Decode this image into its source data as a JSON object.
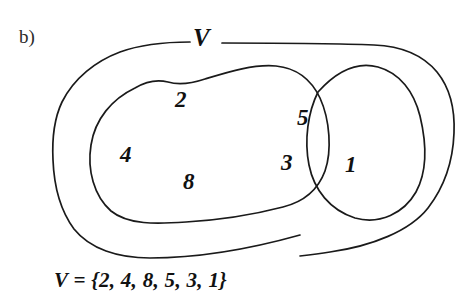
{
  "figure": {
    "part_label": "b)",
    "universe_label": "V",
    "caption": "V = {2, 4, 8, 5, 3, 1}",
    "ink_color": "#111111",
    "background_color": "#ffffff"
  },
  "regions": {
    "universal_set": {
      "name": "V",
      "icon": "rounded-outer-boundary-curve"
    },
    "left_set": {
      "icon": "left-blob-curve",
      "elements": [
        "2",
        "4",
        "8"
      ]
    },
    "right_set": {
      "icon": "right-blob-curve",
      "elements": [
        "1"
      ]
    },
    "intersection": {
      "icon": "lens-region",
      "elements": [
        "5",
        "3"
      ]
    }
  },
  "elements": [
    {
      "value": "2",
      "region": "left-set-only"
    },
    {
      "value": "4",
      "region": "left-set-only"
    },
    {
      "value": "8",
      "region": "left-set-only"
    },
    {
      "value": "5",
      "region": "intersection"
    },
    {
      "value": "3",
      "region": "intersection"
    },
    {
      "value": "1",
      "region": "right-set-only"
    }
  ]
}
